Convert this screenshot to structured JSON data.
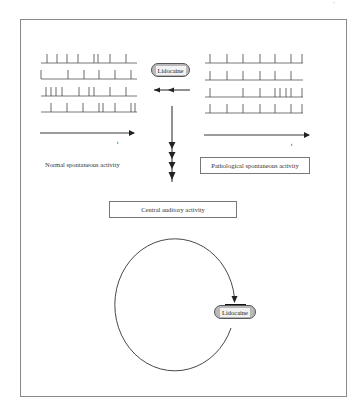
{
  "page": {
    "corner_mark": "ʼ"
  },
  "diagram": {
    "title": "",
    "left_panel": {
      "label": "Normal spontaneous activity",
      "time_axis_label": "t",
      "spike_trains": [
        {
          "baseline_y": 63,
          "x_start": 41,
          "x_end": 137,
          "spikes": [
            47,
            57,
            67,
            78,
            94,
            98,
            110,
            126
          ]
        },
        {
          "baseline_y": 79,
          "x_start": 41,
          "x_end": 137,
          "spikes": [
            41,
            68,
            84,
            99,
            115,
            131
          ]
        },
        {
          "baseline_y": 96,
          "x_start": 41,
          "x_end": 137,
          "spikes": [
            46,
            51,
            56,
            62,
            79,
            89,
            94,
            110,
            126
          ]
        },
        {
          "baseline_y": 112,
          "x_start": 41,
          "x_end": 137,
          "spikes": [
            51,
            67,
            83,
            99,
            103,
            115,
            131,
            135
          ]
        }
      ]
    },
    "right_panel": {
      "label": "Pathological spontaneous activity",
      "time_axis_label": "t",
      "spike_trains": [
        {
          "baseline_y": 63,
          "x_start": 205,
          "x_end": 303,
          "spikes": [
            210,
            227,
            243,
            260,
            275,
            291,
            302
          ]
        },
        {
          "baseline_y": 80,
          "x_start": 205,
          "x_end": 303,
          "spikes": [
            210,
            227,
            243,
            260,
            275,
            291
          ]
        },
        {
          "baseline_y": 97,
          "x_start": 205,
          "x_end": 303,
          "spikes": [
            210,
            243,
            260,
            275,
            280,
            286,
            291,
            302
          ]
        },
        {
          "baseline_y": 113,
          "x_start": 205,
          "x_end": 303,
          "spikes": [
            210,
            227,
            243,
            260,
            275,
            291,
            302
          ]
        }
      ]
    },
    "lidocaine_top": {
      "label": "Lidocaine"
    },
    "lidocaine_loop": {
      "label": "Lidocaine"
    },
    "central_box": {
      "label": "Central auditory activity"
    },
    "colors": {
      "line": "#333333",
      "frame": "#8a8a8a",
      "pill_fill": "#b9b9b9",
      "pill_inner": "#f2f2f2"
    }
  }
}
